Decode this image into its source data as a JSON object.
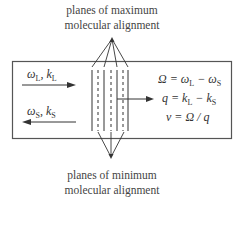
{
  "labels": {
    "top_line1": "planes of maximum",
    "top_line2": "molecular alignment",
    "bottom_line1": "planes of minimum",
    "bottom_line2": "molecular alignment"
  },
  "waves": {
    "laser": {
      "omega": "ω",
      "omega_sub": "L",
      "sep": ", ",
      "k": "k",
      "k_sub": "L",
      "direction": "right"
    },
    "stokes": {
      "omega": "ω",
      "omega_sub": "S",
      "sep": ", ",
      "k": "k",
      "k_sub": "S",
      "direction": "left"
    }
  },
  "equations": {
    "eq1": {
      "lhs": "Ω = ω",
      "sub1": "L",
      "mid": " − ω",
      "sub2": "S"
    },
    "eq2": {
      "lhs": "q = k",
      "sub1": "L",
      "mid": " − k",
      "sub2": "S"
    },
    "eq3": {
      "text": "v = Ω / q"
    }
  },
  "colors": {
    "line": "#333333",
    "box": "#555555",
    "text": "#333333"
  }
}
